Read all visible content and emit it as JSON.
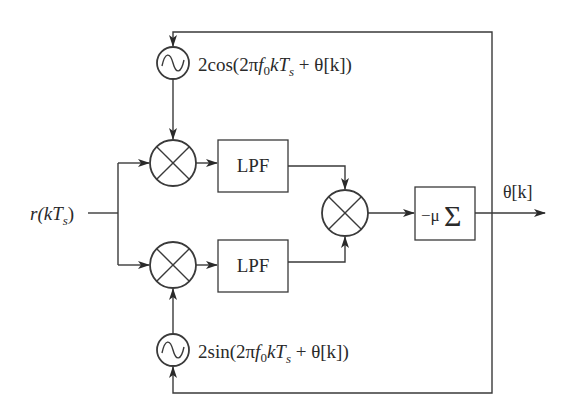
{
  "diagram": {
    "type": "block-diagram",
    "input": {
      "label_main": "r(kT",
      "label_sub": "s",
      "label_close": ")"
    },
    "output": {
      "label": "θ[k]"
    },
    "oscillators": [
      {
        "id": "cos-oscillator",
        "label_prefix": "2cos(2π",
        "label_f": "f",
        "label_f_sub": "0",
        "label_k": "kT",
        "label_s_sub": "s",
        "label_suffix": " + θ[k])"
      },
      {
        "id": "sin-oscillator",
        "label_prefix": "2sin(2π",
        "label_f": "f",
        "label_f_sub": "0",
        "label_k": "kT",
        "label_s_sub": "s",
        "label_suffix": " + θ[k])"
      }
    ],
    "filters": [
      {
        "id": "lpf-top",
        "label": "LPF"
      },
      {
        "id": "lpf-bottom",
        "label": "LPF"
      }
    ],
    "accumulator": {
      "label_mu": "−μ",
      "label_sigma": "Σ"
    },
    "colors": {
      "stroke": "#3a3a3a",
      "text": "#2a2a2a",
      "background": "#ffffff"
    }
  }
}
